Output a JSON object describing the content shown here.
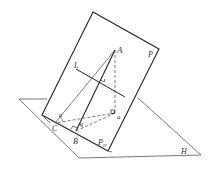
{
  "diagram": {
    "title": "",
    "labels": {
      "A": "A",
      "P": "P",
      "L": "L",
      "C": "C",
      "B": "B",
      "a": "a",
      "PH": "P",
      "PH_sub": "H",
      "H": "H",
      "alpha1": "α",
      "alpha2": "α",
      "alpha_small": "₁"
    },
    "colors": {
      "stroke": "#333333",
      "background": "#ffffff"
    }
  }
}
